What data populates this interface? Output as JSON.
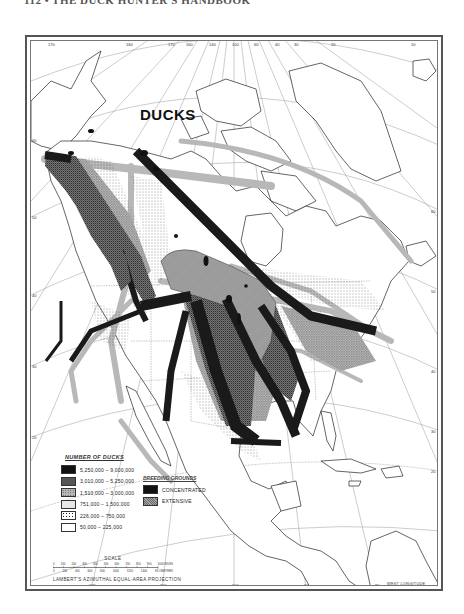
{
  "page": {
    "header": "112 • THE DUCK HUNTER'S HANDBOOK"
  },
  "map": {
    "title": "DUCKS",
    "projection": "LAMBERT'S AZIMUTHAL EQUAL-AREA PROJECTION",
    "west_longitude_label": "WEST LONGITUDE",
    "top_longitude_ticks": [
      {
        "label": "170",
        "x": 19
      },
      {
        "label": "160",
        "x": 97
      },
      {
        "label": "170",
        "x": 139
      },
      {
        "label": "160",
        "x": 157
      },
      {
        "label": "140",
        "x": 180
      },
      {
        "label": "100",
        "x": 203
      },
      {
        "label": "60",
        "x": 225
      },
      {
        "label": "40",
        "x": 246
      },
      {
        "label": "30",
        "x": 265
      },
      {
        "label": "20",
        "x": 302
      },
      {
        "label": "10",
        "x": 382
      }
    ],
    "bottom_longitude_ticks": [
      {
        "label": "120",
        "x": 60
      },
      {
        "label": "110",
        "x": 131
      },
      {
        "label": "100",
        "x": 203
      },
      {
        "label": "90",
        "x": 275
      },
      {
        "label": "80",
        "x": 346
      }
    ],
    "left_latitude_ticks": [
      {
        "label": "60",
        "y": 99
      },
      {
        "label": "50",
        "y": 176
      },
      {
        "label": "40",
        "y": 254
      },
      {
        "label": "30",
        "y": 325
      },
      {
        "label": "20",
        "y": 396
      }
    ],
    "right_latitude_ticks": [
      {
        "label": "60",
        "y": 170
      },
      {
        "label": "50",
        "y": 250
      },
      {
        "label": "40",
        "y": 330
      },
      {
        "label": "30",
        "y": 390
      },
      {
        "label": "20",
        "y": 430
      }
    ]
  },
  "legend": {
    "title": "NUMBER OF DUCKS",
    "items": [
      {
        "label": "5,250,000 – 9,000,000",
        "pattern": "black-dense"
      },
      {
        "label": "3,010,000 – 5,250,000",
        "pattern": "dark-stipple"
      },
      {
        "label": "1,510,000 – 3,000,000",
        "pattern": "medium-stipple"
      },
      {
        "label": "751,000 – 1,500,000",
        "pattern": "light-gray"
      },
      {
        "label": "226,000 – 750,000",
        "pattern": "sparse-dots"
      },
      {
        "label": "50,000 – 225,000",
        "pattern": "white"
      }
    ]
  },
  "breeding_grounds": {
    "title": "BREEDING GROUNDS",
    "items": [
      {
        "label": "CONCENTRATED",
        "pattern": "solid-black"
      },
      {
        "label": "EXTENSIVE",
        "pattern": "gray-hatch"
      }
    ]
  },
  "scale": {
    "title": "SCALE",
    "miles_ticks": [
      "0",
      "100",
      "200",
      "300",
      "400",
      "500",
      "600",
      "700",
      "800",
      "900",
      "1000 MILES"
    ],
    "km_ticks": [
      "0",
      "200",
      "400",
      "600",
      "800",
      "1000",
      "1200",
      "1400",
      "KILOMETERS"
    ]
  },
  "colors": {
    "ink": "#111111",
    "dark_flyway": "#1a1a1a",
    "medium_flyway": "#555555",
    "light_flyway": "#a8a8a8",
    "breeding_extensive": "#9a9a9a",
    "grid": "#999999",
    "paper": "#ffffff"
  }
}
